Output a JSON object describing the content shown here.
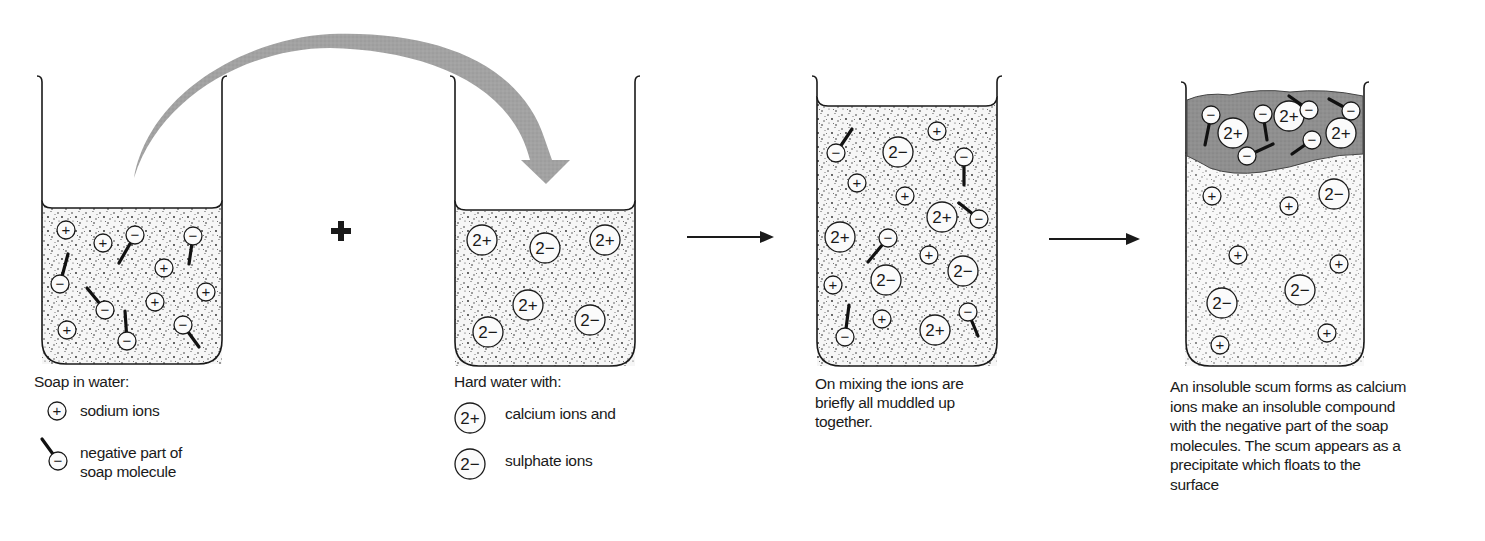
{
  "colors": {
    "ink": "#1a1a1a",
    "arrow_gray": "#9a9a9a",
    "scum_gray": "#8e8e8e",
    "liquid_bg": "#f4f4f4",
    "stipple": "#3a3a3a"
  },
  "operators": {
    "plus_sign": "+",
    "arrow_1": "→",
    "arrow_2": "→"
  },
  "beakers": [
    {
      "id": "soap-in-water",
      "caption_title": "Soap in water:",
      "legend": [
        {
          "symbol": "+",
          "kind": "sodium",
          "label_lines": [
            "sodium ions"
          ]
        },
        {
          "symbol": "−",
          "kind": "soap",
          "label_lines": [
            "negative part of",
            "soap molecule"
          ]
        }
      ]
    },
    {
      "id": "hard-water",
      "caption_title": "Hard water with:",
      "legend": [
        {
          "symbol": "2+",
          "kind": "calcium",
          "label_lines": [
            "calcium ions and"
          ]
        },
        {
          "symbol": "2−",
          "kind": "sulphate",
          "label_lines": [
            "sulphate ions"
          ]
        }
      ]
    },
    {
      "id": "mixed",
      "caption_lines": [
        "On mixing the ions are",
        "briefly all muddled up",
        "together."
      ]
    },
    {
      "id": "scum",
      "caption_lines": [
        "An insoluble scum forms as calcium",
        "ions make an insoluble compound",
        "with the negative part of the soap",
        "molecules. The scum appears as a",
        "precipitate which floats to the",
        "surface"
      ]
    }
  ],
  "ion_labels": {
    "sodium": "+",
    "soap": "−",
    "calcium": "2+",
    "sulphate": "2−"
  }
}
